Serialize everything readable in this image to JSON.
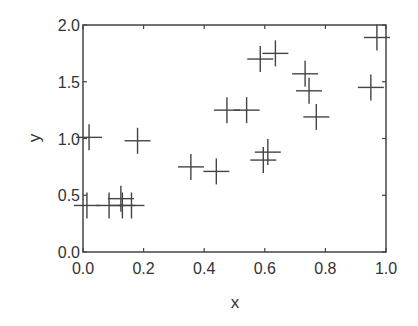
{
  "chart_data": {
    "type": "scatter",
    "title": "",
    "xlabel": "x",
    "ylabel": "y",
    "xlim": [
      0.0,
      1.0
    ],
    "ylim": [
      0.0,
      2.0
    ],
    "grid": false,
    "legend": null,
    "marker": "plus",
    "marker_color": "#444444",
    "xticks": [
      "0.0",
      "0.2",
      "0.4",
      "0.6",
      "0.8",
      "1.0"
    ],
    "yticks": [
      "0.0",
      "0.5",
      "1.0",
      "1.5",
      "2.0"
    ],
    "series": [
      {
        "name": "points",
        "x": [
          0.013,
          0.086,
          0.125,
          0.13,
          0.16,
          0.02,
          0.18,
          0.356,
          0.44,
          0.475,
          0.54,
          0.595,
          0.61,
          0.585,
          0.635,
          0.733,
          0.746,
          0.77,
          0.97,
          0.95
        ],
        "y": [
          0.41,
          0.41,
          0.47,
          0.41,
          0.41,
          1.01,
          0.98,
          0.75,
          0.71,
          1.25,
          1.25,
          0.81,
          0.88,
          1.7,
          1.75,
          1.57,
          1.42,
          1.19,
          1.89,
          1.45
        ]
      }
    ]
  }
}
